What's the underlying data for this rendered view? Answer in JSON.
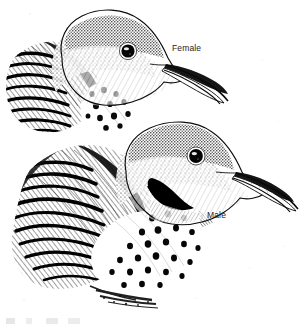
{
  "illustration": {
    "title": "Northern Flicker head study",
    "medium": "pen-and-ink stipple and hatching",
    "background_color": "#ffffff",
    "ink_color": "#111111",
    "width_px": 301,
    "height_px": 326,
    "subjects": [
      {
        "id": "female-flicker",
        "label": "Female",
        "position": "upper-left",
        "field_marks": [
          "no black malar stripe",
          "stippled grey-brown crown",
          "pale buff face and throat",
          "long slightly decurved bill",
          "barred wing coverts",
          "spotted white breast"
        ]
      },
      {
        "id": "male-flicker",
        "label": "Male",
        "position": "lower-right",
        "field_marks": [
          "solid black malar stripe (moustache)",
          "stippled grey-brown crown",
          "pale buff face and throat",
          "long slightly decurved bill",
          "barred wing coverts",
          "heavily spotted white breast"
        ]
      }
    ]
  },
  "labels": {
    "female": "Female",
    "male": "Male"
  }
}
